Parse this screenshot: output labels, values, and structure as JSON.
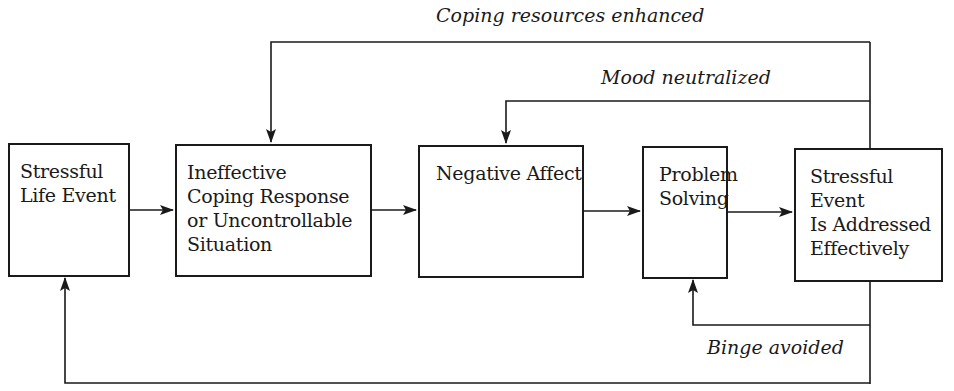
{
  "diagram": {
    "boxes": [
      {
        "id": "stressful-life-event",
        "label": "Stressful\nLife Event"
      },
      {
        "id": "ineffective-coping",
        "label": "Ineffective\nCoping Response\nor Uncontrollable\nSituation"
      },
      {
        "id": "negative-affect",
        "label": "Negative Affect"
      },
      {
        "id": "problem-solving",
        "label": "Problem\nSolving"
      },
      {
        "id": "event-addressed",
        "label": "Stressful\nEvent\nIs Addressed\nEffectively"
      }
    ],
    "feedback_labels": {
      "coping_resources": "Coping resources enhanced",
      "mood": "Mood neutralized",
      "binge": "Binge avoided"
    },
    "edges": [
      {
        "from": "stressful-life-event",
        "to": "ineffective-coping"
      },
      {
        "from": "ineffective-coping",
        "to": "negative-affect"
      },
      {
        "from": "negative-affect",
        "to": "problem-solving"
      },
      {
        "from": "problem-solving",
        "to": "event-addressed"
      },
      {
        "from": "event-addressed",
        "to": "ineffective-coping",
        "label": "Coping resources enhanced"
      },
      {
        "from": "event-addressed",
        "to": "negative-affect",
        "label": "Mood neutralized"
      },
      {
        "from": "event-addressed",
        "to": "problem-solving",
        "label": "Binge avoided"
      },
      {
        "from": "event-addressed",
        "to": "stressful-life-event"
      }
    ]
  }
}
